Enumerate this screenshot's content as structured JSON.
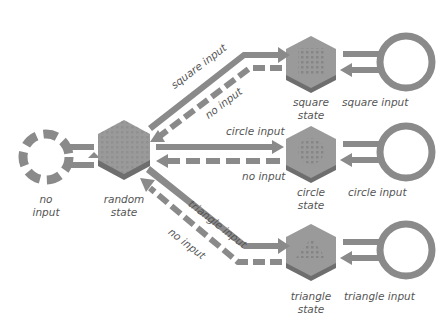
{
  "diagram": {
    "type": "state-transition",
    "colors": {
      "arrow": "#8a8a8a",
      "arrow_edge": "#6a6a6a",
      "hex_top": "#9a9a9a",
      "hex_side": "#6e6e6e",
      "text": "#555555",
      "background": "#ffffff"
    },
    "nodes": {
      "no_input": {
        "label_line1": "no",
        "label_line2": "input"
      },
      "random_state": {
        "label_line1": "random",
        "label_line2": "state"
      },
      "square_state": {
        "label_line1": "square",
        "label_line2": "state"
      },
      "circle_state": {
        "label_line1": "circle",
        "label_line2": "state"
      },
      "triangle_state": {
        "label_line1": "triangle",
        "label_line2": "state"
      }
    },
    "loops": {
      "square": "square input",
      "circle": "circle input",
      "triangle": "triangle input"
    },
    "edges": {
      "to_square": "square input",
      "from_square": "no input",
      "to_circle": "circle input",
      "from_circle": "no input",
      "to_triangle": "triangle input",
      "from_triangle": "no input"
    }
  }
}
